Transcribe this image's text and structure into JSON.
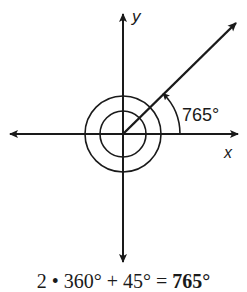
{
  "diagram": {
    "type": "coterminal-angle",
    "axes": {
      "x_label": "x",
      "y_label": "y"
    },
    "angle_label": "765°",
    "angle_degrees": 765,
    "terminal_side_degrees": 45,
    "full_rotations": 2
  },
  "equation": {
    "left": "2 • 360° + 45° = ",
    "result": "765°"
  },
  "colors": {
    "ink": "#1a1a1a",
    "background": "#ffffff"
  }
}
